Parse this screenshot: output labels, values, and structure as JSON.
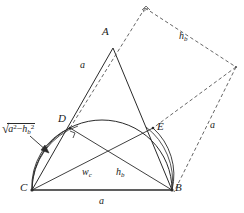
{
  "figure": {
    "canvas": {
      "width": 244,
      "height": 213
    },
    "stroke_color": "#2a2a2a",
    "dash_color": "#555555",
    "background": "#ffffff"
  },
  "points": {
    "A": {
      "label": "A",
      "x": 113,
      "y": 48,
      "label_x": 102,
      "label_y": 26
    },
    "B": {
      "label": "B",
      "x": 172,
      "y": 190,
      "label_x": 175,
      "label_y": 182
    },
    "C": {
      "label": "C",
      "x": 32,
      "y": 190,
      "label_x": 20,
      "label_y": 182
    },
    "D": {
      "label": "D",
      "x": 70,
      "y": 128,
      "label_x": 58,
      "label_y": 113
    },
    "E": {
      "label": "E",
      "x": 153,
      "y": 128,
      "label_x": 157,
      "label_y": 121
    },
    "P": {
      "label": "",
      "x": 145,
      "y": 8
    },
    "Q": {
      "label": "",
      "x": 236,
      "y": 67
    }
  },
  "segment_labels": {
    "side_ca": {
      "text": "a",
      "x": 80,
      "y": 60
    },
    "base_cb": {
      "text": "a",
      "x": 99,
      "y": 196
    },
    "cevian_bd": {
      "text": "w",
      "sub": "c",
      "x": 82,
      "y": 167
    },
    "cevian_ce": {
      "text": "h",
      "sub": "b",
      "x": 116,
      "y": 167
    },
    "dash_top": {
      "text": "h",
      "sub": "b",
      "x": 179,
      "y": 31
    },
    "dash_right": {
      "text": "a",
      "x": 210,
      "y": 120
    }
  },
  "radical_label": {
    "radical_sign": "√",
    "base1": "a",
    "exp1": "2",
    "operator": "−",
    "base2": "h",
    "sub2": "b",
    "exp2": "2",
    "x": 2,
    "y": 122,
    "arrow_from_x": 30,
    "arrow_from_y": 136,
    "arrow_to_x": 48,
    "arrow_to_y": 152
  },
  "markers": {
    "right_angle_at_D": {
      "x": 72,
      "y": 132
    },
    "right_angle_at_P": {
      "x": 145,
      "y": 8
    }
  },
  "arcs": {
    "thales_semicircle": {
      "from": "C",
      "to": "B",
      "through_top_y": 118
    },
    "arc_centered_C": {
      "center": "C",
      "radius": 63
    },
    "arc_centered_B": {
      "center": "B",
      "radius": 63
    }
  }
}
